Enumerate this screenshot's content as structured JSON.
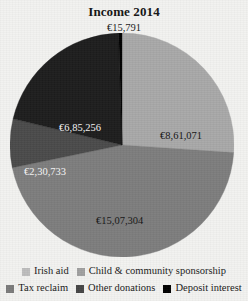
{
  "chart_data": {
    "type": "pie",
    "title": "Income 2014",
    "xlabel": "",
    "ylabel": "",
    "currency_symbol": "€",
    "legend_position": "bottom",
    "grid": false,
    "categories": [
      "Irish aid",
      "Child & community sponsorship",
      "Tax reclaim",
      "Other donations",
      "Deposit interest"
    ],
    "values": [
      861071,
      1507304,
      230733,
      685256,
      15791
    ],
    "value_labels": [
      "€8,61,071",
      "€15,07,304",
      "€2,30,733",
      "€6,85,256",
      "€15,791"
    ],
    "colors": [
      "#a8a8a8",
      "#7d7d7d",
      "#4a4a4a",
      "#000000",
      "#5f5f5f"
    ],
    "slices": [
      {
        "name": "Irish aid",
        "value": 861071,
        "label": "€8,61,071",
        "color": "#a8a8a8",
        "start_angle": 0,
        "end_angle": 93.9,
        "label_x": 150,
        "label_y": 98,
        "label_tone": "dark"
      },
      {
        "name": "Child & community sponsorship",
        "value": 1507304,
        "label": "€15,07,304",
        "color": "#7d7d7d",
        "start_angle": 93.9,
        "end_angle": 258.3,
        "label_x": 86,
        "label_y": 183,
        "label_tone": "dark"
      },
      {
        "name": "Tax reclaim",
        "value": 230733,
        "label": "€2,30,733",
        "color": "#4a4a4a",
        "start_angle": 258.3,
        "end_angle": 283.5,
        "label_x": 14,
        "label_y": 134,
        "label_tone": "light"
      },
      {
        "name": "Other donations",
        "value": 685256,
        "label": "€6,85,256",
        "color": "#1d1d1d",
        "start_angle": 283.5,
        "end_angle": 358.3,
        "label_x": 49,
        "label_y": 90,
        "label_tone": "light"
      },
      {
        "name": "Deposit interest",
        "value": 15791,
        "label": "€15,791",
        "color": "#000000",
        "start_angle": 358.3,
        "end_angle": 360,
        "label_x": 92,
        "label_y": 22,
        "label_tone": "dark"
      }
    ]
  },
  "header": {
    "title": "Income 2014"
  },
  "top_label": {
    "text": "€15,791"
  },
  "legend": {
    "rows": [
      [
        {
          "label": "Irish aid",
          "color": "#bdbdbd"
        },
        {
          "label": "Child & community sponsorship",
          "color": "#a0a0a0"
        }
      ],
      [
        {
          "label": "Tax reclaim",
          "color": "#7b7b7b"
        },
        {
          "label": "Other donations",
          "color": "#454545"
        },
        {
          "label": "Deposit interest",
          "color": "#000000"
        }
      ]
    ]
  }
}
